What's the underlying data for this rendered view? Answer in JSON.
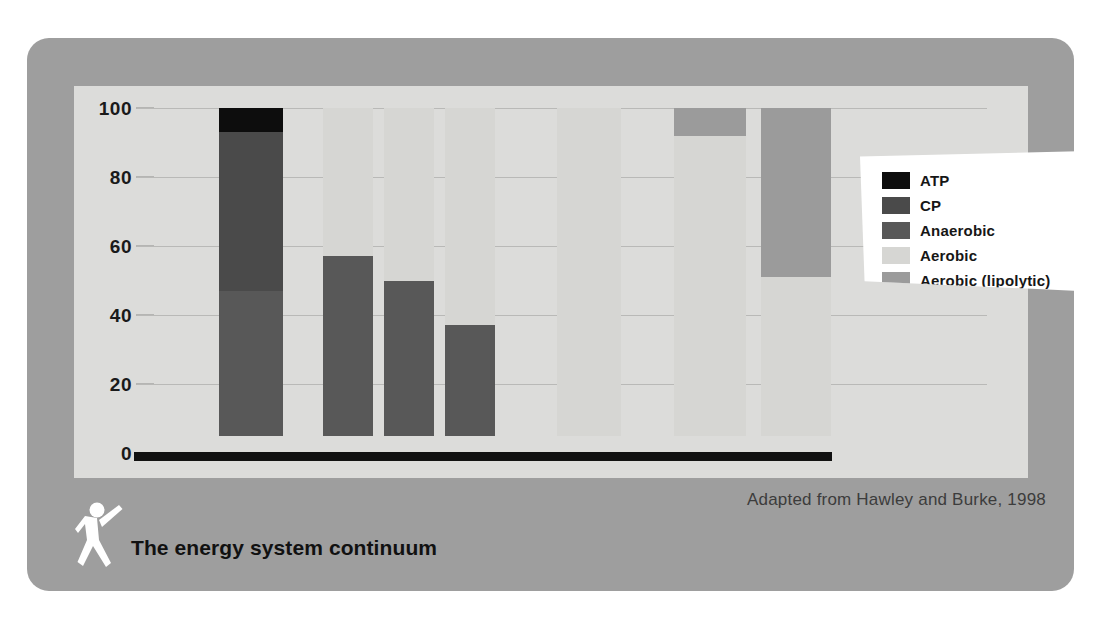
{
  "figure": {
    "title": "The energy system continuum",
    "source_note": "Adapted from Hawley and Burke, 1998",
    "logo_name": "running-person-logo"
  },
  "colors": {
    "atp": "#0d0d0d",
    "cp": "#4a4a4a",
    "anaerobic": "#585858",
    "aerobic": "#d6d6d3",
    "aerobic_lipolytic": "#9b9b9b",
    "card_background": "#9e9e9e",
    "panel_background": "#dcdcda",
    "gridline": "#b9b9b7",
    "axis": "#111111",
    "legend_background": "#ffffff"
  },
  "chart_data": {
    "type": "bar",
    "title": "The energy system continuum",
    "xlabel": "",
    "ylabel": "",
    "ylim": [
      0,
      100
    ],
    "yticks": [
      0,
      20,
      40,
      60,
      80,
      100
    ],
    "grid": true,
    "stacked": true,
    "legend_position": "top-right",
    "categories": [
      "1",
      "2",
      "3",
      "4",
      "5",
      "6",
      "7"
    ],
    "series": [
      {
        "name": "ATP",
        "color": "#0d0d0d",
        "values": [
          7,
          0,
          0,
          0,
          0,
          0,
          0
        ]
      },
      {
        "name": "CP",
        "color": "#4a4a4a",
        "values": [
          46,
          0,
          0,
          0,
          0,
          0,
          0
        ]
      },
      {
        "name": "Anaerobic",
        "color": "#585858",
        "values": [
          42,
          52,
          45,
          32,
          0,
          0,
          0
        ]
      },
      {
        "name": "Aerobic",
        "color": "#d6d6d3",
        "values": [
          0,
          43,
          50,
          63,
          95,
          87,
          46
        ]
      },
      {
        "name": "Aerobic (lipolytic)",
        "color": "#9b9b9b",
        "values": [
          0,
          0,
          0,
          0,
          0,
          8,
          49
        ]
      }
    ],
    "bar_segments": [
      {
        "bar": 1,
        "left_pct": 9.6,
        "width_pct": 7.6,
        "segments": [
          {
            "series": "Anaerobic",
            "from": 5,
            "to": 47
          },
          {
            "series": "CP",
            "from": 47,
            "to": 93
          },
          {
            "series": "ATP",
            "from": 93,
            "to": 100
          }
        ]
      },
      {
        "bar": 2,
        "left_pct": 21.9,
        "width_pct": 5.9,
        "segments": [
          {
            "series": "Anaerobic",
            "from": 5,
            "to": 57
          },
          {
            "series": "Aerobic",
            "from": 57,
            "to": 100
          }
        ]
      },
      {
        "bar": 3,
        "left_pct": 29.1,
        "width_pct": 5.9,
        "segments": [
          {
            "series": "Anaerobic",
            "from": 5,
            "to": 50
          },
          {
            "series": "Aerobic",
            "from": 50,
            "to": 100
          }
        ]
      },
      {
        "bar": 4,
        "left_pct": 36.2,
        "width_pct": 5.9,
        "segments": [
          {
            "series": "Anaerobic",
            "from": 5,
            "to": 37
          },
          {
            "series": "Aerobic",
            "from": 37,
            "to": 100
          }
        ]
      },
      {
        "bar": 5,
        "left_pct": 49.4,
        "width_pct": 7.6,
        "segments": [
          {
            "series": "Aerobic",
            "from": 5,
            "to": 100
          }
        ]
      },
      {
        "bar": 6,
        "left_pct": 63.2,
        "width_pct": 8.4,
        "segments": [
          {
            "series": "Aerobic",
            "from": 5,
            "to": 92
          },
          {
            "series": "Aerobic (lipolytic)",
            "from": 92,
            "to": 100
          }
        ]
      },
      {
        "bar": 7,
        "left_pct": 73.4,
        "width_pct": 8.2,
        "segments": [
          {
            "series": "Aerobic",
            "from": 5,
            "to": 51
          },
          {
            "series": "Aerobic (lipolytic)",
            "from": 51,
            "to": 100
          }
        ]
      }
    ]
  },
  "legend": {
    "items": [
      {
        "label": "ATP",
        "color": "#0d0d0d"
      },
      {
        "label": "CP",
        "color": "#4a4a4a"
      },
      {
        "label": "Anaerobic",
        "color": "#585858"
      },
      {
        "label": "Aerobic",
        "color": "#d6d6d3"
      },
      {
        "label": "Aerobic  (lipolytic)",
        "color": "#9b9b9b"
      }
    ]
  }
}
